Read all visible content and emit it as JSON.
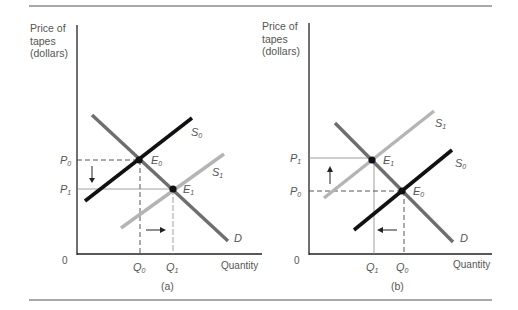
{
  "figure": {
    "panels": [
      {
        "id": "a",
        "caption": "(a)",
        "y_axis_label": [
          "Price of",
          "tapes",
          "(dollars)"
        ],
        "x_axis_label": "Quantity",
        "origin_label": "0",
        "curves": {
          "demand": {
            "label": "D"
          },
          "supply_initial": {
            "label": "S",
            "sub": "0"
          },
          "supply_new": {
            "label": "S",
            "sub": "1"
          }
        },
        "equilibria": [
          {
            "label": "E",
            "sub": "0"
          },
          {
            "label": "E",
            "sub": "1"
          }
        ],
        "price_ticks": [
          {
            "label": "P",
            "sub": "0"
          },
          {
            "label": "P",
            "sub": "1"
          }
        ],
        "quantity_ticks": [
          {
            "label": "Q",
            "sub": "0"
          },
          {
            "label": "Q",
            "sub": "1"
          }
        ]
      },
      {
        "id": "b",
        "caption": "(b)",
        "y_axis_label": [
          "Price of",
          "tapes",
          "(dollars)"
        ],
        "x_axis_label": "Quantity",
        "origin_label": "0",
        "curves": {
          "demand": {
            "label": "D"
          },
          "supply_initial": {
            "label": "S",
            "sub": "0"
          },
          "supply_new": {
            "label": "S",
            "sub": "1"
          }
        },
        "equilibria": [
          {
            "label": "E",
            "sub": "1"
          },
          {
            "label": "E",
            "sub": "0"
          }
        ],
        "price_ticks": [
          {
            "label": "P",
            "sub": "1"
          },
          {
            "label": "P",
            "sub": "0"
          }
        ],
        "quantity_ticks": [
          {
            "label": "Q",
            "sub": "1"
          },
          {
            "label": "Q",
            "sub": "0"
          }
        ]
      }
    ],
    "colors": {
      "rule": "#555555",
      "axis": "#222222",
      "demand": "#6e6e6e",
      "supply_initial": "#111111",
      "supply_new": "#b4b4b4",
      "guide": "#444444",
      "text": "#555555"
    }
  }
}
